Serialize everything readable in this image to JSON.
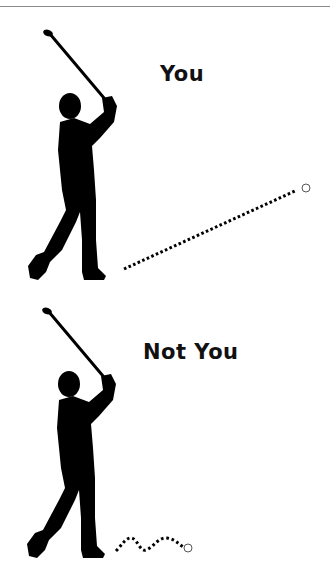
{
  "panels": [
    {
      "caption": "You",
      "shot": "long-straight"
    },
    {
      "caption": "Not You",
      "shot": "short-wobbly"
    }
  ],
  "colors": {
    "silhouette": "#000000",
    "text": "#111111",
    "ball_stroke": "#555555",
    "divider": "#8a8a8a"
  }
}
